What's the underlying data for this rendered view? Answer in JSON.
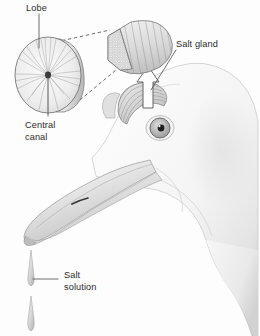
{
  "figure": {
    "background_color": "#fdfdfd",
    "ink_color": "#2b2b2b",
    "line_color": "#4a4a4a",
    "tissue_fill": "#e2e2e2",
    "head_fill": "#f2f2f2"
  },
  "labels": {
    "lobe": "Lobe",
    "central_canal_line1": "Central",
    "central_canal_line2": "canal",
    "salt_gland": "Salt gland",
    "salt_solution_line1": "Salt",
    "salt_solution_line2": "solution"
  },
  "parts": [
    {
      "name": "lobe-cross-section",
      "description": "disc with radial lobules"
    },
    {
      "name": "central-canal",
      "description": "dark dot at disc centre"
    },
    {
      "name": "gland-tissue-block",
      "description": "cut block with stippled face"
    },
    {
      "name": "salt-gland-on-head",
      "description": "crescent striated gland above eye"
    },
    {
      "name": "callout-arrow",
      "description": "hollow outline arrow"
    },
    {
      "name": "bird-head",
      "description": "pale seabird head in profile"
    },
    {
      "name": "bird-eye",
      "description": "round eye with dark pupil"
    },
    {
      "name": "bird-beak",
      "description": "long hooked bill with nostril"
    },
    {
      "name": "salt-droplet-upper",
      "description": "teardrop of salt solution"
    },
    {
      "name": "salt-droplet-lower",
      "description": "teardrop of salt solution"
    }
  ]
}
